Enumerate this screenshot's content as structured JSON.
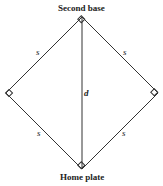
{
  "diagram": {
    "top_label": "Second base",
    "bottom_label": "Home plate",
    "side_label": "s",
    "diagonal_label": "d",
    "line_color": "#333333"
  }
}
